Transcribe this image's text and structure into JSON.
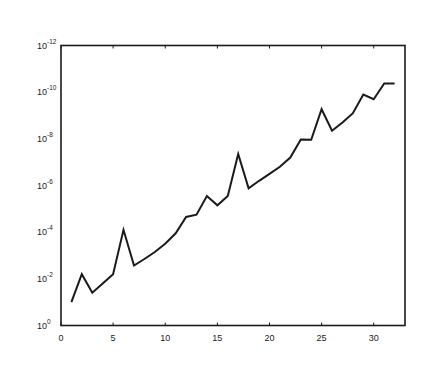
{
  "chart_data": {
    "type": "line",
    "title": "",
    "xlabel": "",
    "ylabel": "",
    "yscale": "log",
    "xlim": [
      0,
      33
    ],
    "ylim_exp": [
      -12,
      0
    ],
    "grid": false,
    "legend": null,
    "x_ticks": [
      0,
      5,
      10,
      15,
      20,
      25,
      30
    ],
    "x_tick_labels": [
      "0",
      "5",
      "10",
      "15",
      "20",
      "25",
      "30"
    ],
    "y_ticks_exp": [
      0,
      -2,
      -4,
      -6,
      -8,
      -10,
      -12
    ],
    "y_tick_labels": [
      {
        "base": "10",
        "exp": "0"
      },
      {
        "base": "10",
        "exp": "-2"
      },
      {
        "base": "10",
        "exp": "-4"
      },
      {
        "base": "10",
        "exp": "-6"
      },
      {
        "base": "10",
        "exp": "-8"
      },
      {
        "base": "10",
        "exp": "-10"
      },
      {
        "base": "10",
        "exp": "-12"
      }
    ],
    "series": [
      {
        "name": "series-1",
        "color": "#1a1a1a",
        "x": [
          1,
          2,
          3,
          4,
          5,
          6,
          7,
          8,
          9,
          10,
          11,
          12,
          13,
          14,
          15,
          16,
          17,
          18,
          19,
          20,
          21,
          22,
          23,
          24,
          25,
          26,
          27,
          28,
          29,
          30,
          31,
          32
        ],
        "log10_y": [
          -1.0,
          -2.2,
          -1.4,
          -1.8,
          -2.2,
          -4.1,
          -2.57,
          -2.85,
          -3.15,
          -3.5,
          -3.95,
          -4.65,
          -4.75,
          -5.55,
          -5.15,
          -5.55,
          -7.35,
          -5.88,
          -6.2,
          -6.5,
          -6.8,
          -7.2,
          -7.97,
          -7.96,
          -9.27,
          -8.35,
          -8.7,
          -9.1,
          -9.9,
          -9.7,
          -10.37,
          -10.37
        ]
      }
    ]
  },
  "colors": {
    "axis": "#1a1a1a",
    "line": "#1a1a1a",
    "background": "#ffffff"
  }
}
